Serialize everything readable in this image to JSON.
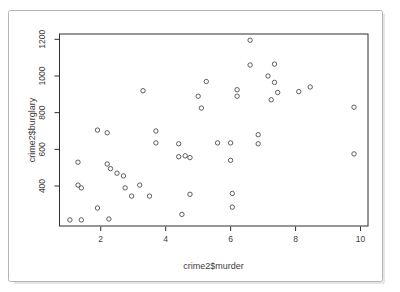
{
  "figure": {
    "background": "#ffffff",
    "frame_color": "#b4b4b4",
    "shadow_color": "#dedede",
    "axis_color": "#2e2e2e",
    "tick_text_color": "#3d3d3d",
    "point_color": "#4d4d4d"
  },
  "chart_data": {
    "type": "scatter",
    "title": "",
    "xlabel": "crime2$murder",
    "ylabel": "crime2$burglary",
    "marker": "open-circle",
    "grid": false,
    "legend": null,
    "xlim": [
      0.73,
      10.23
    ],
    "ylim": [
      182,
      1229
    ],
    "x_ticks": [
      2,
      4,
      6,
      8,
      10
    ],
    "y_ticks": [
      400,
      600,
      800,
      1000,
      1200
    ],
    "points": [
      [
        3.3,
        920
      ],
      [
        5.0,
        890
      ],
      [
        5.1,
        825
      ],
      [
        5.25,
        970
      ],
      [
        6.6,
        1195
      ],
      [
        6.6,
        1060
      ],
      [
        7.35,
        1065
      ],
      [
        7.15,
        1000
      ],
      [
        7.35,
        965
      ],
      [
        6.2,
        925
      ],
      [
        6.2,
        890
      ],
      [
        7.45,
        910
      ],
      [
        7.25,
        870
      ],
      [
        8.1,
        915
      ],
      [
        8.45,
        940
      ],
      [
        9.8,
        830
      ],
      [
        1.9,
        705
      ],
      [
        2.2,
        690
      ],
      [
        3.7,
        700
      ],
      [
        3.7,
        635
      ],
      [
        4.4,
        630
      ],
      [
        1.3,
        530
      ],
      [
        4.4,
        560
      ],
      [
        4.6,
        565
      ],
      [
        4.75,
        555
      ],
      [
        2.2,
        520
      ],
      [
        2.3,
        495
      ],
      [
        2.5,
        470
      ],
      [
        2.7,
        455
      ],
      [
        1.3,
        405
      ],
      [
        1.4,
        390
      ],
      [
        2.75,
        390
      ],
      [
        2.95,
        345
      ],
      [
        3.2,
        405
      ],
      [
        3.5,
        345
      ],
      [
        4.75,
        355
      ],
      [
        1.9,
        280
      ],
      [
        2.25,
        220
      ],
      [
        1.05,
        215
      ],
      [
        1.4,
        215
      ],
      [
        4.5,
        245
      ],
      [
        6.85,
        680
      ],
      [
        6.85,
        630
      ],
      [
        5.6,
        635
      ],
      [
        6.0,
        635
      ],
      [
        6.0,
        540
      ],
      [
        6.05,
        360
      ],
      [
        6.05,
        285
      ],
      [
        9.8,
        575
      ]
    ]
  }
}
